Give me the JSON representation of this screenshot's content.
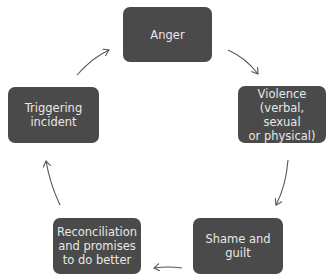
{
  "diagram": {
    "type": "cycle",
    "colors": {
      "node_fill": "#4a4a4a",
      "node_text": "#e8e8e8",
      "arrow": "#555555",
      "background": "#ffffff"
    },
    "nodes": [
      {
        "id": "anger",
        "label": "Anger"
      },
      {
        "id": "violence",
        "label": "Violence\n(verbal, sexual\nor physical)"
      },
      {
        "id": "shame",
        "label": "Shame and\nguilt"
      },
      {
        "id": "reconciliation",
        "label": "Reconciliation\nand promises\nto do better"
      },
      {
        "id": "triggering",
        "label": "Triggering\nincident"
      }
    ],
    "edges": [
      {
        "from": "triggering",
        "to": "anger"
      },
      {
        "from": "anger",
        "to": "violence"
      },
      {
        "from": "violence",
        "to": "shame"
      },
      {
        "from": "shame",
        "to": "reconciliation"
      },
      {
        "from": "reconciliation",
        "to": "triggering"
      }
    ]
  }
}
